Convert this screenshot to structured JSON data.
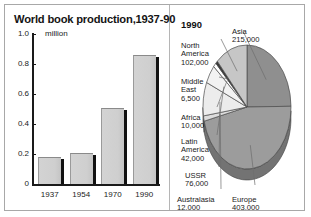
{
  "figure": {
    "border_color": "#a8a8a8",
    "background": "#ffffff"
  },
  "bar_panel": {
    "title": "World book production,1937-90",
    "unit": "million"
  },
  "pie_panel": {
    "year_heading": "1990"
  },
  "chart_data": [
    {
      "type": "bar",
      "title": "World book production,1937-90",
      "xlabel": "",
      "ylabel": "million",
      "categories": [
        "1937",
        "1954",
        "1970",
        "1990"
      ],
      "values": [
        0.18,
        0.21,
        0.51,
        0.86
      ],
      "ylim": [
        0,
        1.0
      ],
      "yticks": [
        "0",
        "0.2",
        "0.4",
        "0.6",
        "0.8",
        "1.0"
      ],
      "ytick_values": [
        0,
        0.2,
        0.4,
        0.6,
        0.8,
        1.0
      ],
      "grid": false,
      "legend": "none",
      "bar_fill": "#d0d0d0",
      "bar_shadow": "#111111"
    },
    {
      "type": "pie",
      "title": "1990",
      "legend": "labels-around-pie",
      "unit": "titles published",
      "slices": [
        {
          "name": "Asia",
          "label": "Asia",
          "value": 215000,
          "value_text": "215,000",
          "shade": "#8f8f8f"
        },
        {
          "name": "Europe",
          "label": "Europe",
          "value": 403000,
          "value_text": "403,000",
          "shade": "#9c9c9c"
        },
        {
          "name": "Australasia",
          "label": "Australasia",
          "value": 12000,
          "value_text": "12,000",
          "shade": "#dcdcdc"
        },
        {
          "name": "USSR",
          "label": "USSR",
          "value": 76000,
          "value_text": "76,000",
          "shade": "#ececec"
        },
        {
          "name": "Latin America",
          "label": "Latin\nAmerica",
          "value": 42000,
          "value_text": "42,000",
          "shade": "#f2f2f2"
        },
        {
          "name": "Africa",
          "label": "Africa",
          "value": 10000,
          "value_text": "10,000",
          "shade": "#ffffff"
        },
        {
          "name": "Middle East",
          "label": "Middle\nEast",
          "value": 6500,
          "value_text": "6,500",
          "shade": "#3a3a3a"
        },
        {
          "name": "North America",
          "label": "North\nAmerica",
          "value": 102000,
          "value_text": "102,000",
          "shade": "#c6c6c6"
        }
      ],
      "total": 866500
    }
  ],
  "pie_labels": {
    "north_america": {
      "name": "North\nAmerica",
      "value": "102,000"
    },
    "middle_east": {
      "name": "Middle\nEast",
      "value": "6,500"
    },
    "africa": {
      "name": "Africa",
      "value": "10,000"
    },
    "latin_america": {
      "name": "Latin\nAmerica",
      "value": "42,000"
    },
    "ussr": {
      "name": "USSR",
      "value": "76,000"
    },
    "australasia": {
      "name": "Australasia",
      "value": "12,000"
    },
    "europe": {
      "name": "Europe",
      "value": "403,000"
    },
    "asia": {
      "name": "Asia",
      "value": "215,000"
    }
  }
}
